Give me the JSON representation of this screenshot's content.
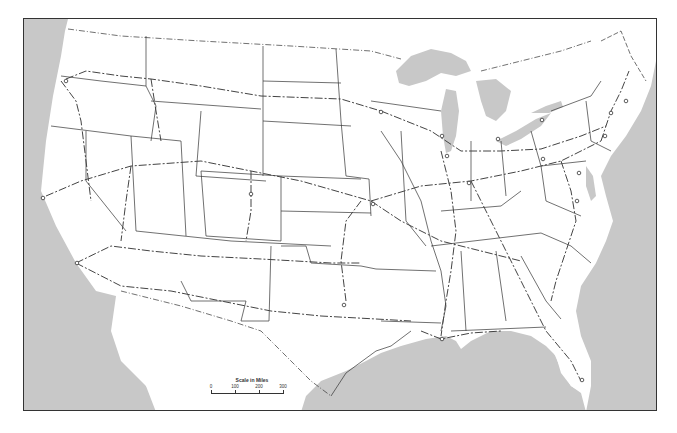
{
  "map": {
    "title": "United States railroad network outline map",
    "colors": {
      "water": "#c8c8c8",
      "land": "#ffffff",
      "border": "#333333",
      "railroad": "#444444"
    },
    "features": {
      "water_bodies": [
        "Pacific Ocean",
        "Atlantic Ocean",
        "Gulf of Mexico",
        "Gulf of California",
        "Lake Superior",
        "Lake Michigan",
        "Lake Huron",
        "Lake Erie",
        "Lake Ontario"
      ],
      "city_markers_count": 20
    }
  },
  "scale": {
    "title": "Scale in Miles",
    "ticks": [
      "0",
      "100",
      "200",
      "300"
    ]
  }
}
